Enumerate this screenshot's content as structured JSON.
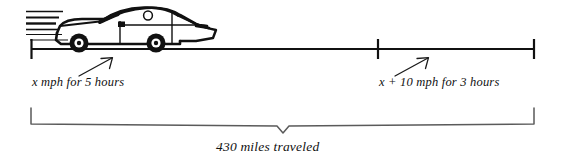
{
  "diagram": {
    "type": "number-line-distance-rate-time",
    "title_text": "",
    "colors": {
      "stroke": "#111111",
      "brace": "#4a4a4a",
      "background": "#ffffff"
    },
    "illustration": {
      "name": "speeding-car",
      "description": "cartoon side-view car with motion speed lines",
      "speed_line_count": 6
    },
    "axis": {
      "left_tick_x": 31,
      "middle_tick_x": 378,
      "right_tick_x": 535,
      "line_y": 49
    },
    "segments": [
      {
        "id": "segment-1",
        "label": "x mph for 5 hours",
        "rate": "x",
        "rate_units": "mph",
        "time": 5,
        "time_units": "hours",
        "arrow": "up-right"
      },
      {
        "id": "segment-2",
        "label": "x + 10 mph for 3 hours",
        "rate": "x + 10",
        "rate_units": "mph",
        "time": 3,
        "time_units": "hours",
        "arrow": "up-right"
      }
    ],
    "total": {
      "label": "430 miles traveled",
      "value": 430,
      "units": "miles"
    }
  }
}
